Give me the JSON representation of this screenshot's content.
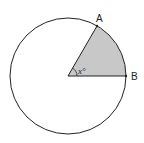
{
  "diagram": {
    "type": "circle-sector",
    "labels": {
      "point_a": "A",
      "point_b": "B",
      "angle": "x°"
    },
    "colors": {
      "sector_fill": "#c8c8c8",
      "stroke": "#222222",
      "background": "#ffffff"
    }
  }
}
